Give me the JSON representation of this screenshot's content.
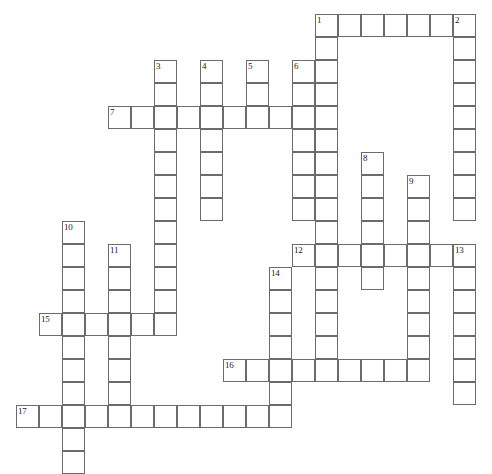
{
  "puzzle": {
    "type": "crossword-grid",
    "title": "",
    "grid_columns": 21,
    "grid_rows": 20,
    "cell_size_px": 23,
    "origin_x_px": 16,
    "origin_y_px": 14,
    "cell_border_color": "#6b6b6b",
    "cell_fill_color": "#ffffff",
    "background_color": "#ffffff",
    "number_color": "#1a1a1a",
    "entries": [
      {
        "number": "1",
        "direction": "across",
        "col": 13,
        "row": 0,
        "length": 7
      },
      {
        "number": "1",
        "direction": "down",
        "col": 13,
        "row": 0,
        "length": 16
      },
      {
        "number": "2",
        "direction": "down",
        "col": 19,
        "row": 0,
        "length": 9
      },
      {
        "number": "3",
        "direction": "down",
        "col": 6,
        "row": 2,
        "length": 11
      },
      {
        "number": "4",
        "direction": "down",
        "col": 8,
        "row": 2,
        "length": 7
      },
      {
        "number": "5",
        "direction": "down",
        "col": 10,
        "row": 2,
        "length": 3
      },
      {
        "number": "6",
        "direction": "down",
        "col": 12,
        "row": 2,
        "length": 7
      },
      {
        "number": "7",
        "direction": "across",
        "col": 4,
        "row": 4,
        "length": 10
      },
      {
        "number": "8",
        "direction": "down",
        "col": 15,
        "row": 6,
        "length": 6
      },
      {
        "number": "9",
        "direction": "down",
        "col": 17,
        "row": 7,
        "length": 9
      },
      {
        "number": "10",
        "direction": "down",
        "col": 2,
        "row": 9,
        "length": 11
      },
      {
        "number": "11",
        "direction": "down",
        "col": 4,
        "row": 10,
        "length": 7
      },
      {
        "number": "12",
        "direction": "across",
        "col": 12,
        "row": 10,
        "length": 8
      },
      {
        "number": "13",
        "direction": "down",
        "col": 19,
        "row": 10,
        "length": 7
      },
      {
        "number": "14",
        "direction": "down",
        "col": 11,
        "row": 11,
        "length": 7
      },
      {
        "number": "15",
        "direction": "across",
        "col": 1,
        "row": 13,
        "length": 6
      },
      {
        "number": "16",
        "direction": "across",
        "col": 9,
        "row": 15,
        "length": 8
      },
      {
        "number": "17",
        "direction": "across",
        "col": 0,
        "row": 17,
        "length": 11
      }
    ],
    "numbered_labels": [
      {
        "label": "1",
        "col": 13,
        "row": 0
      },
      {
        "label": "2",
        "col": 19,
        "row": 0
      },
      {
        "label": "3",
        "col": 6,
        "row": 2
      },
      {
        "label": "4",
        "col": 8,
        "row": 2
      },
      {
        "label": "5",
        "col": 10,
        "row": 2
      },
      {
        "label": "6",
        "col": 12,
        "row": 2
      },
      {
        "label": "7",
        "col": 4,
        "row": 4
      },
      {
        "label": "8",
        "col": 15,
        "row": 6
      },
      {
        "label": "9",
        "col": 17,
        "row": 7
      },
      {
        "label": "10",
        "col": 2,
        "row": 9
      },
      {
        "label": "11",
        "col": 4,
        "row": 10
      },
      {
        "label": "12",
        "col": 12,
        "row": 10
      },
      {
        "label": "13",
        "col": 19,
        "row": 10
      },
      {
        "label": "14",
        "col": 11,
        "row": 11
      },
      {
        "label": "15",
        "col": 1,
        "row": 13
      },
      {
        "label": "16",
        "col": 9,
        "row": 15
      },
      {
        "label": "17",
        "col": 0,
        "row": 17
      }
    ]
  }
}
